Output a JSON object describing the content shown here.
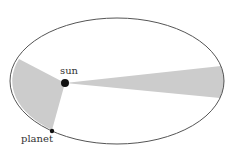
{
  "diagram": {
    "labels": {
      "sun": "sun",
      "planet": "planet"
    },
    "colors": {
      "orbit": "#555555",
      "sector": "#cccccc",
      "body": "#111111"
    }
  }
}
